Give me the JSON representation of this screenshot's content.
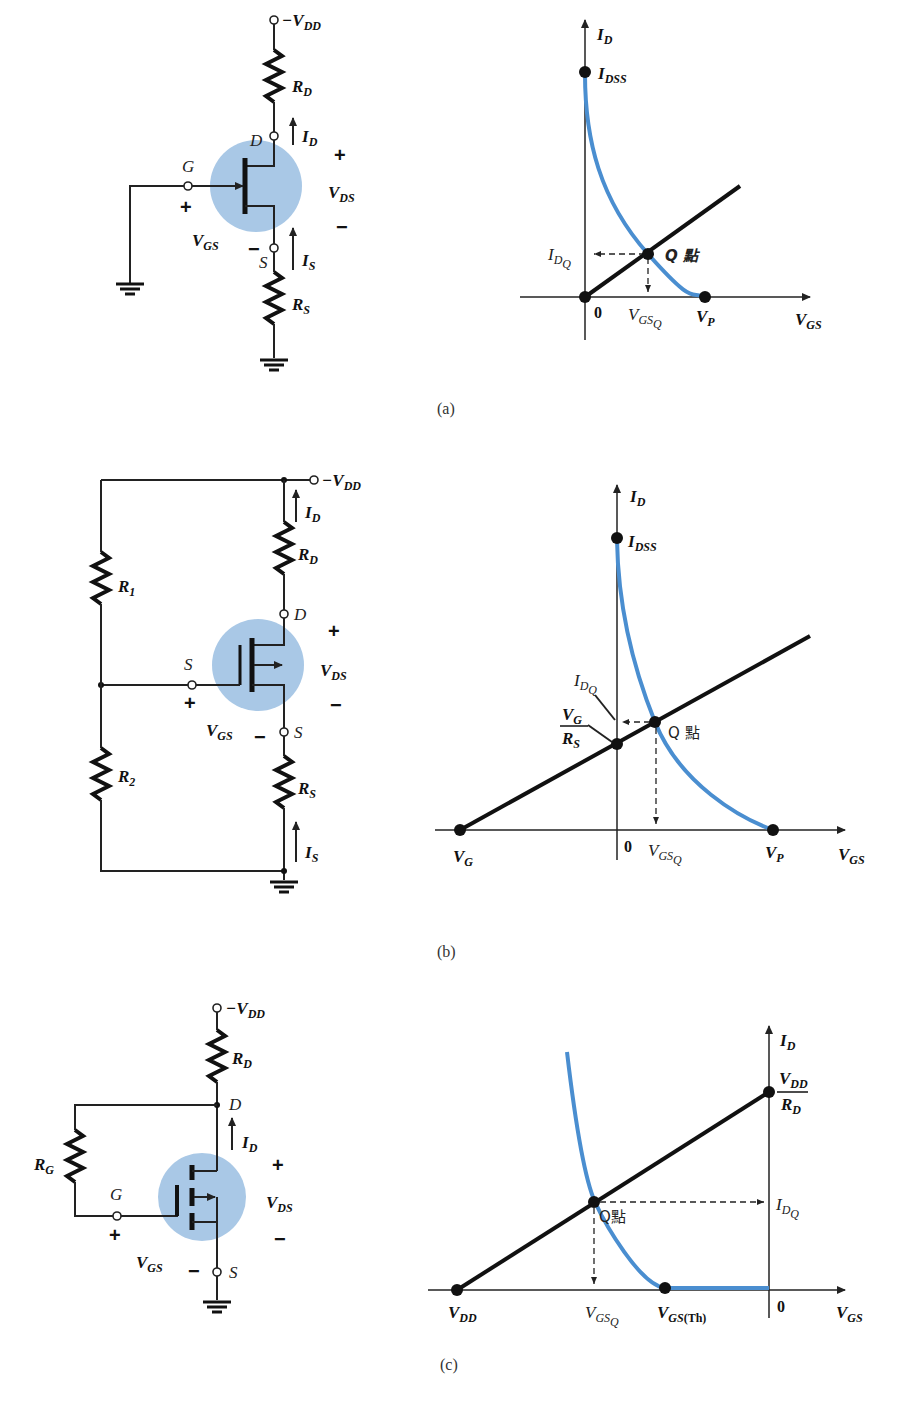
{
  "figure": {
    "panels": [
      {
        "id": "a",
        "caption": "(a)",
        "circuit": {
          "type": "p-channel JFET self-bias",
          "labels": {
            "supply": "−V",
            "supply_sub": "DD",
            "rd": "R",
            "rd_sub": "D",
            "id": "I",
            "id_sub": "D",
            "drain": "D",
            "gate": "G",
            "source": "S",
            "is": "I",
            "is_sub": "S",
            "rs": "R",
            "rs_sub": "S",
            "vgs": "V",
            "vgs_sub": "GS",
            "vds": "V",
            "vds_sub": "DS",
            "plus": "+",
            "minus": "−"
          }
        },
        "graph": {
          "y_axis": "I",
          "y_axis_sub": "D",
          "x_axis": "V",
          "x_axis_sub": "GS",
          "idss": "I",
          "idss_sub": "DSS",
          "idq": "I",
          "idq_sub": "D",
          "idq_subsub": "Q",
          "q_point": "Q 點",
          "vgsq": "V",
          "vgsq_sub": "GS",
          "vgsq_subsub": "Q",
          "vp": "V",
          "vp_sub": "P",
          "origin": "0"
        }
      },
      {
        "id": "b",
        "caption": "(b)",
        "circuit": {
          "type": "p-channel depletion MOSFET voltage-divider bias",
          "labels": {
            "supply": "−V",
            "supply_sub": "DD",
            "id": "I",
            "id_sub": "D",
            "rd": "R",
            "rd_sub": "D",
            "r1": "R",
            "r1_sub": "1",
            "r2": "R",
            "r2_sub": "2",
            "drain": "D",
            "gate": "S",
            "source": "S",
            "rs": "R",
            "rs_sub": "S",
            "is": "I",
            "is_sub": "S",
            "vgs": "V",
            "vgs_sub": "GS",
            "vds": "V",
            "vds_sub": "DS",
            "plus": "+",
            "minus": "−"
          }
        },
        "graph": {
          "y_axis": "I",
          "y_axis_sub": "D",
          "x_axis": "V",
          "x_axis_sub": "GS",
          "idss": "I",
          "idss_sub": "DSS",
          "idq": "I",
          "idq_sub": "D",
          "idq_subsub": "Q",
          "vg_over_rs_num": "V",
          "vg_over_rs_num_sub": "G",
          "vg_over_rs_den": "R",
          "vg_over_rs_den_sub": "S",
          "q_point": "Q 點",
          "vg": "V",
          "vg_sub": "G",
          "vgsq": "V",
          "vgsq_sub": "GS",
          "vgsq_subsub": "Q",
          "vp": "V",
          "vp_sub": "P",
          "origin": "0"
        }
      },
      {
        "id": "c",
        "caption": "(c)",
        "circuit": {
          "type": "p-channel enhancement MOSFET drain-feedback bias",
          "labels": {
            "supply": "−V",
            "supply_sub": "DD",
            "rd": "R",
            "rd_sub": "D",
            "rg": "R",
            "rg_sub": "G",
            "drain": "D",
            "id": "I",
            "id_sub": "D",
            "gate": "G",
            "source": "S",
            "vgs": "V",
            "vgs_sub": "GS",
            "vds": "V",
            "vds_sub": "DS",
            "plus": "+",
            "minus": "−"
          }
        },
        "graph": {
          "y_axis": "I",
          "y_axis_sub": "D",
          "x_axis": "V",
          "x_axis_sub": "GS",
          "vdd_over_rd_num": "V",
          "vdd_over_rd_num_sub": "DD",
          "vdd_over_rd_den": "R",
          "vdd_over_rd_den_sub": "D",
          "idq": "I",
          "idq_sub": "D",
          "idq_subsub": "Q",
          "q_point": "Q點",
          "vdd": "V",
          "vdd_sub": "DD",
          "vgsq": "V",
          "vgsq_sub": "GS",
          "vgsq_subsub": "Q",
          "vgsth": "V",
          "vgsth_sub": "GS",
          "vgsth_paren": "(Th)",
          "origin": "0"
        }
      }
    ],
    "colors": {
      "transistor_highlight": "#a9c8e6",
      "transfer_curve": "#4a8ed0",
      "ink": "#111111"
    }
  }
}
